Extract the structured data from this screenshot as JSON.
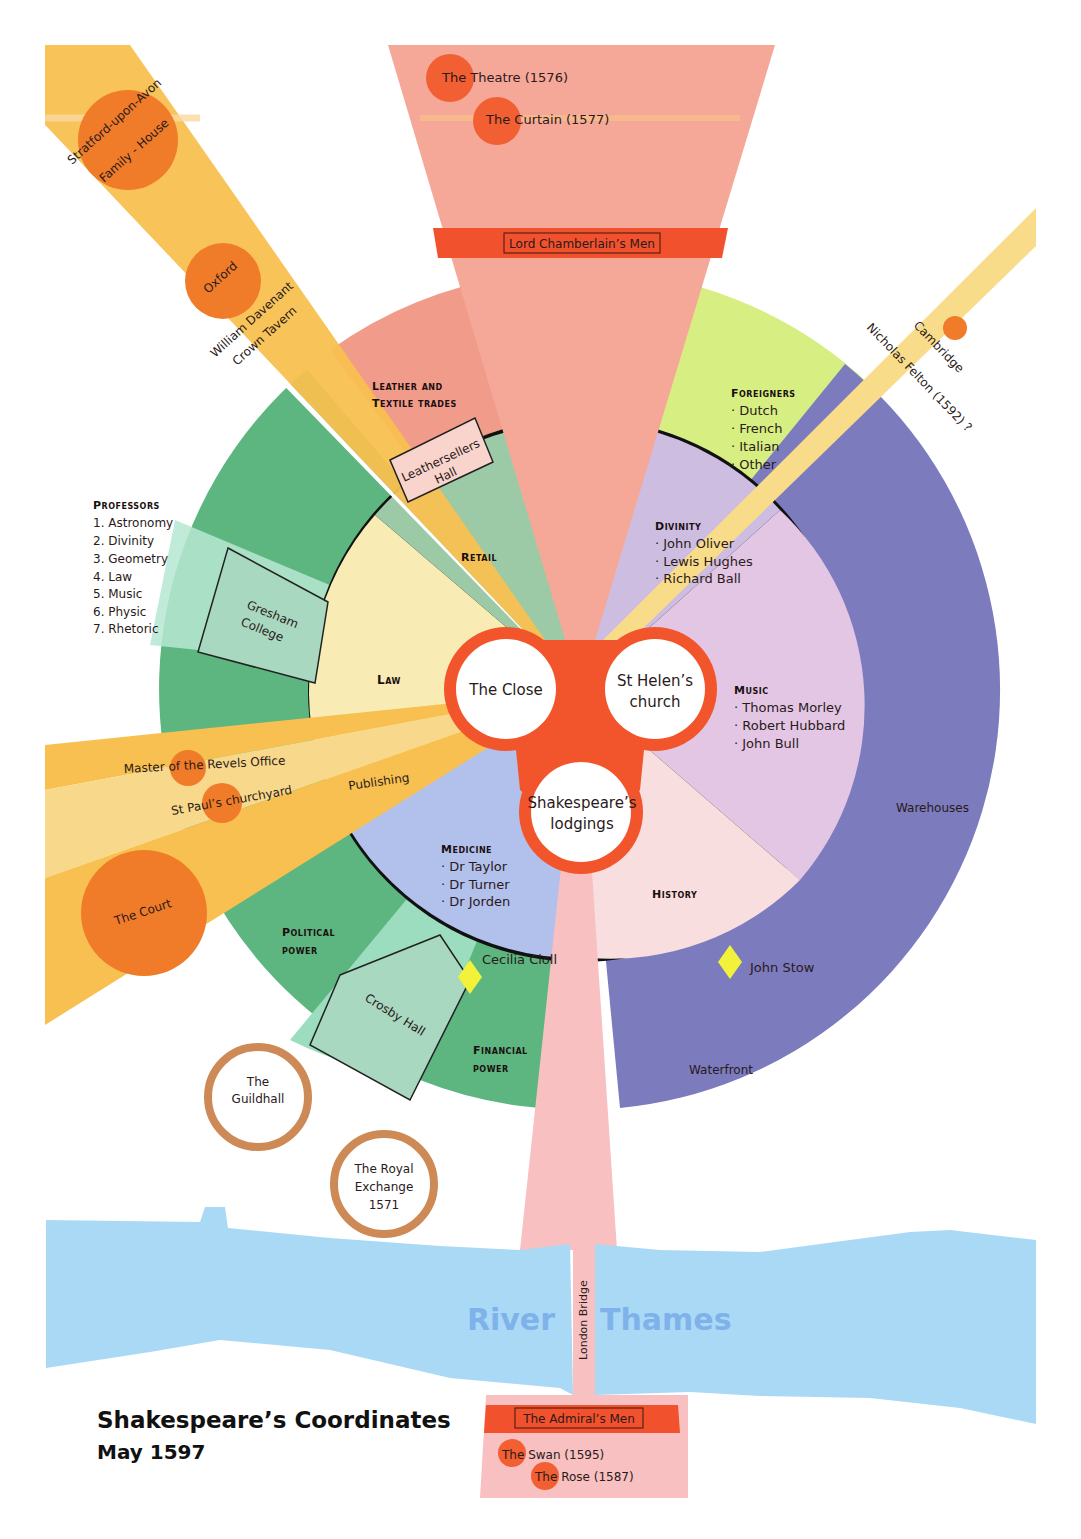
{
  "title": {
    "main": "Shakespeare’s Coordinates",
    "date": "May 1597"
  },
  "colors": {
    "theatre_wedge": "#f6a898",
    "theatre_band": "#f2512e",
    "orange_circle": "#f07c2a",
    "yellow_ray": "#f8c050",
    "pale_yellow_ray": "#f8dc8a",
    "green_outer": "#5db57f",
    "mint": "#9cdcbf",
    "leather": "#f19c8a",
    "foreigners": "#d6ee82",
    "warehouses": "#7b7bbd",
    "law": "#f8ebb4",
    "retail": "#9ccaa6",
    "divinity": "#cdbde0",
    "music": "#e2c6e4",
    "history": "#f8dede",
    "medicine": "#b2c0ec",
    "core_ring": "#f2552c",
    "guild_ring": "#cd8a56",
    "river": "#aad9f6",
    "river_text": "#7fb2ea",
    "diamond": "#f2f23a"
  },
  "center": {
    "nodes": [
      {
        "label_lines": [
          "The Close"
        ]
      },
      {
        "label_lines": [
          "St Helen’s",
          "church"
        ]
      },
      {
        "label_lines": [
          "Shakespeare’s",
          "lodgings"
        ]
      }
    ]
  },
  "north": {
    "band_label": "Lord Chamberlain’s Men",
    "venues": [
      "The Theatre (1576)",
      "The Curtain (1577)"
    ]
  },
  "south": {
    "band_label": "The Admiral’s Men",
    "venues": [
      "The Swan (1595)",
      "The Rose (1587)"
    ]
  },
  "rays": {
    "stratford_line1": "Stratford-upon-Avon",
    "stratford_line2": "Family - House",
    "oxford": "Oxford",
    "davenant_line1": "William Davenant",
    "davenant_line2": "Crown Tavern",
    "cambridge": "Cambridge",
    "felton": "Nicholas Felton (1592) ?",
    "revels": "Master of the Revels Office",
    "publishing": "Publishing",
    "st_pauls": "St Paul’s churchyard",
    "court": "The Court"
  },
  "outer_ring": {
    "leather_line1": "Leather and",
    "leather_line2": "Textile trades",
    "leathersellers_line1": "Leathersellers",
    "leathersellers_line2": "Hall",
    "foreigners_heading": "Foreigners",
    "foreigners_items": [
      "· Dutch",
      "· French",
      "· Italian",
      "· Other"
    ],
    "warehouses": "Warehouses",
    "waterfront": "Waterfront",
    "political_line1": "Political",
    "political_line2": "power",
    "financial_line1": "Financial",
    "financial_line2": "power",
    "crosby": "Crosby Hall",
    "gresham_line1": "Gresham",
    "gresham_line2": "College",
    "professors_heading": "Professors",
    "professors_items": [
      "1. Astronomy",
      "2. Divinity",
      "3. Geometry",
      "4. Law",
      "5. Music",
      "6. Physic",
      "7. Rhetoric"
    ]
  },
  "inner_disc": {
    "law": "Law",
    "retail": "Retail",
    "divinity_heading": "Divinity",
    "divinity_items": [
      "· John Oliver",
      "· Lewis Hughes",
      "· Richard Ball"
    ],
    "music_heading": "Music",
    "music_items": [
      "· Thomas Morley",
      "· Robert Hubbard",
      "· John Bull"
    ],
    "history_heading": "History",
    "medicine_heading": "Medicine",
    "medicine_items": [
      "· Dr Taylor",
      "· Dr Turner",
      "· Dr Jorden"
    ]
  },
  "markers": {
    "cecilia": "Cecilia Cioll",
    "stow": "John Stow"
  },
  "civic": {
    "guildhall_line1": "The",
    "guildhall_line2": "Guildhall",
    "exchange_line1": "The Royal",
    "exchange_line2": "Exchange",
    "exchange_line3": "1571"
  },
  "river": {
    "left": "River",
    "right": "Thames",
    "bridge": "London Bridge"
  }
}
